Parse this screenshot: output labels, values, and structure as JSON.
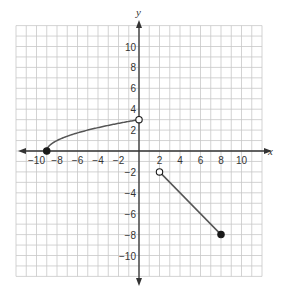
{
  "chart_data": {
    "type": "line",
    "title": "",
    "xlabel": "x",
    "ylabel": "y",
    "xlim": [
      -12,
      12
    ],
    "ylim": [
      -12,
      12
    ],
    "grid": true,
    "grid_step": 1,
    "x_ticks": [
      -10,
      -8,
      -6,
      -4,
      -2,
      2,
      4,
      6,
      8,
      10
    ],
    "y_ticks": [
      10,
      8,
      6,
      4,
      2,
      -2,
      -4,
      -6,
      -8,
      -10
    ],
    "x_tick_labels": [
      "−10",
      "−8",
      "−6",
      "−4",
      "−2",
      "2",
      "4",
      "6",
      "8",
      "10"
    ],
    "y_tick_labels": [
      "10",
      "8",
      "6",
      "4",
      "2",
      "−2",
      "−4",
      "−6",
      "−8",
      "−10"
    ],
    "series": [
      {
        "name": "curve",
        "description": "square-root curve y = sqrt(x + 9) for -9 <= x < 0",
        "x": [
          -9,
          -8,
          -7,
          -6,
          -5,
          -4,
          -3,
          -2,
          -1,
          0
        ],
        "y": [
          0,
          1,
          1.414,
          1.732,
          2,
          2.236,
          2.449,
          2.646,
          2.828,
          3
        ],
        "start": {
          "x": -9,
          "y": 0,
          "marker": "closed"
        },
        "end": {
          "x": 0,
          "y": 3,
          "marker": "open"
        }
      },
      {
        "name": "segment",
        "description": "line segment y = -x for 2 < x <= 8",
        "x": [
          2,
          8
        ],
        "y": [
          -2,
          -8
        ],
        "start": {
          "x": 2,
          "y": -2,
          "marker": "open"
        },
        "end": {
          "x": 8,
          "y": -8,
          "marker": "closed"
        }
      }
    ],
    "colors": {
      "grid": "#c8c8c8",
      "axes": "#333333",
      "curve": "#555555",
      "points": "#1a1a1a"
    }
  }
}
